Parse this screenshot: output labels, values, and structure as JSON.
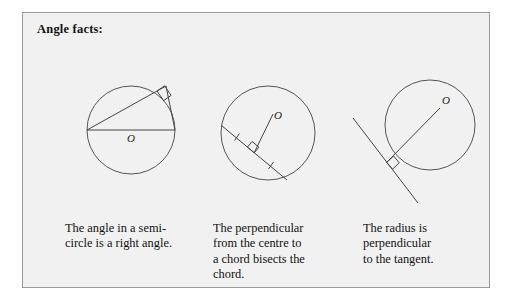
{
  "panel": {
    "title": "Angle facts:",
    "border_color": "#9a9a9a",
    "background_color": "#f1f1f1",
    "ink_color": "#555555"
  },
  "figures": [
    {
      "name": "semicircle-right-angle",
      "center_label": "O",
      "circle": {
        "cx": 108,
        "cy": 117,
        "r": 44
      },
      "elements": [
        "diameter",
        "chord-to-apex-left",
        "chord-to-apex-right",
        "right-angle-mark-at-apex"
      ],
      "apex": {
        "x": 143,
        "y": 73
      }
    },
    {
      "name": "perpendicular-bisects-chord",
      "center_label": "O",
      "circle": {
        "cx": 245,
        "cy": 120,
        "r": 47
      },
      "elements": [
        "chord",
        "perpendicular-from-centre",
        "right-angle-mark",
        "tick-mark-left",
        "tick-mark-right"
      ],
      "chord_start": {
        "x": 199,
        "y": 112
      },
      "chord_end": {
        "x": 262,
        "y": 166
      },
      "foot": {
        "x": 230,
        "y": 139
      }
    },
    {
      "name": "radius-perpendicular-to-tangent",
      "center_label": "O",
      "circle": {
        "cx": 407,
        "cy": 112,
        "r": 45
      },
      "elements": [
        "tangent-line",
        "radius",
        "right-angle-mark"
      ],
      "tangent_point": {
        "x": 364,
        "y": 150
      }
    }
  ],
  "captions": [
    "The angle in a semi-\ncircle is a right angle.",
    "The perpendicular\nfrom the centre to\na chord bisects the\nchord.",
    "The radius is\nperpendicular\nto the tangent."
  ]
}
